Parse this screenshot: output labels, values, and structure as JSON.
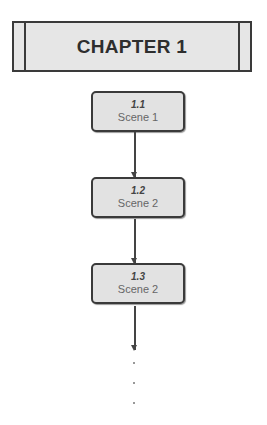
{
  "chapter": {
    "title": "CHAPTER 1"
  },
  "scenes": [
    {
      "number": "1.1",
      "label": "Scene 1"
    },
    {
      "number": "1.2",
      "label": "Scene 2"
    },
    {
      "number": "1.3",
      "label": "Scene 2"
    }
  ],
  "continuation": "..."
}
